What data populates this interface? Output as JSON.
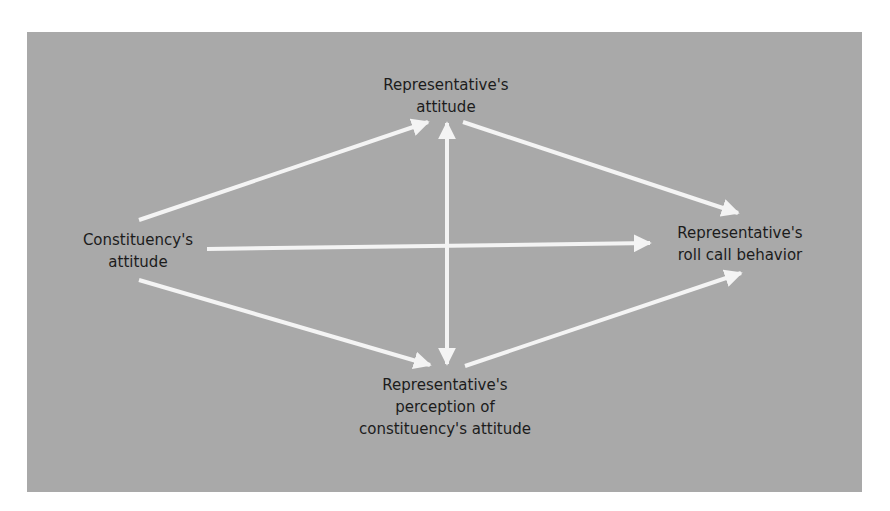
{
  "diagram": {
    "background_color": "#a9a9a9",
    "arrow_color": "#f4f4f4",
    "nodes": {
      "rep_attitude": {
        "line1": "Representative's",
        "line2": "attitude"
      },
      "constituency_attitude": {
        "line1": "Constituency's",
        "line2": "attitude"
      },
      "roll_call": {
        "line1": "Representative's",
        "line2": "roll call behavior"
      },
      "perception": {
        "line1": "Representative's",
        "line2": "perception of",
        "line3": "constituency's attitude"
      }
    },
    "edges": [
      {
        "from": "Constituency's attitude",
        "to": "Representative's attitude",
        "direction": "forward"
      },
      {
        "from": "Constituency's attitude",
        "to": "Representative's roll call behavior",
        "direction": "forward"
      },
      {
        "from": "Constituency's attitude",
        "to": "Representative's perception of constituency's attitude",
        "direction": "forward"
      },
      {
        "from": "Representative's attitude",
        "to": "Representative's roll call behavior",
        "direction": "forward"
      },
      {
        "from": "Representative's perception of constituency's attitude",
        "to": "Representative's roll call behavior",
        "direction": "forward"
      },
      {
        "from": "Representative's attitude",
        "to": "Representative's perception of constituency's attitude",
        "direction": "bidirectional"
      }
    ]
  }
}
